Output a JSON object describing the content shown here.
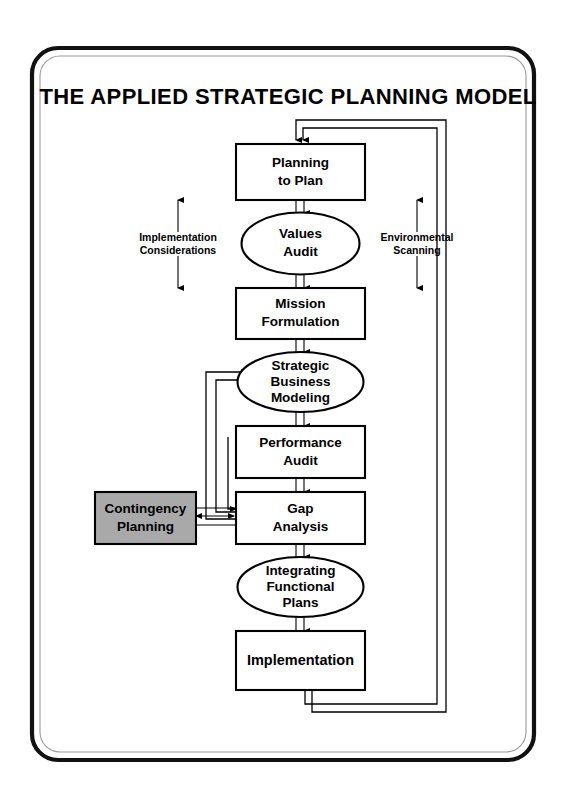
{
  "page": {
    "title": "THE APPLIED STRATEGIC PLANNING MODEL",
    "width": 571,
    "height": 798,
    "background": "#ffffff"
  },
  "colors": {
    "stroke": "#000000",
    "node_fill": "#ffffff",
    "highlight_fill": "#a9a9a9",
    "frame": "#111111",
    "frame_inner": "#9a9a9a"
  },
  "diagram": {
    "type": "flowchart",
    "orientation": "vertical",
    "nodes": [
      {
        "id": "planning-to-plan",
        "shape": "rectangle",
        "label_lines": [
          "Planning",
          "to Plan"
        ],
        "fill": "#ffffff",
        "order": 1
      },
      {
        "id": "values-audit",
        "shape": "ellipse",
        "label_lines": [
          "Values",
          "Audit"
        ],
        "fill": "#ffffff",
        "order": 2
      },
      {
        "id": "mission-formulation",
        "shape": "rectangle",
        "label_lines": [
          "Mission",
          "Formulation"
        ],
        "fill": "#ffffff",
        "order": 3
      },
      {
        "id": "strategic-business-modeling",
        "shape": "ellipse",
        "label_lines": [
          "Strategic",
          "Business",
          "Modeling"
        ],
        "fill": "#ffffff",
        "order": 4
      },
      {
        "id": "performance-audit",
        "shape": "rectangle",
        "label_lines": [
          "Performance",
          "Audit"
        ],
        "fill": "#ffffff",
        "order": 5
      },
      {
        "id": "gap-analysis",
        "shape": "rectangle",
        "label_lines": [
          "Gap",
          "Analysis"
        ],
        "fill": "#ffffff",
        "order": 6
      },
      {
        "id": "contingency-planning",
        "shape": "rectangle",
        "label_lines": [
          "Contingency",
          "Planning"
        ],
        "fill": "#a9a9a9",
        "order": 7
      },
      {
        "id": "integrating-functional-plans",
        "shape": "ellipse",
        "label_lines": [
          "Integrating",
          "Functional",
          "Plans"
        ],
        "fill": "#ffffff",
        "order": 8
      },
      {
        "id": "implementation",
        "shape": "rectangle",
        "label_lines": [
          "Implementation"
        ],
        "fill": "#ffffff",
        "order": 9
      }
    ],
    "side_labels": [
      {
        "id": "implementation-considerations",
        "label_lines": [
          "Implementation",
          "Considerations"
        ],
        "side": "left",
        "arrow": "double-vertical"
      },
      {
        "id": "environmental-scanning",
        "label_lines": [
          "Environmental",
          "Scanning"
        ],
        "side": "right",
        "arrow": "double-vertical"
      }
    ],
    "edges": [
      {
        "from": "planning-to-plan",
        "to": "values-audit",
        "style": "double-line-arrow"
      },
      {
        "from": "values-audit",
        "to": "mission-formulation",
        "style": "double-line-arrow"
      },
      {
        "from": "mission-formulation",
        "to": "strategic-business-modeling",
        "style": "double-line-arrow"
      },
      {
        "from": "strategic-business-modeling",
        "to": "performance-audit",
        "style": "double-line-arrow"
      },
      {
        "from": "performance-audit",
        "to": "gap-analysis",
        "style": "double-line-arrow"
      },
      {
        "from": "gap-analysis",
        "to": "integrating-functional-plans",
        "style": "double-line-arrow"
      },
      {
        "from": "integrating-functional-plans",
        "to": "implementation",
        "style": "double-line-arrow"
      },
      {
        "from": "gap-analysis",
        "to": "strategic-business-modeling",
        "style": "left-feedback-loop"
      },
      {
        "from": "gap-analysis",
        "to": "gap-analysis",
        "style": "left-feedback-loop-short"
      },
      {
        "from": "contingency-planning",
        "to": "gap-analysis",
        "style": "bidirectional-arrow"
      },
      {
        "from": "implementation",
        "to": "planning-to-plan",
        "style": "right-return-loop-outer"
      },
      {
        "from": "implementation",
        "to": "planning-to-plan",
        "style": "right-return-loop-inner"
      }
    ]
  }
}
